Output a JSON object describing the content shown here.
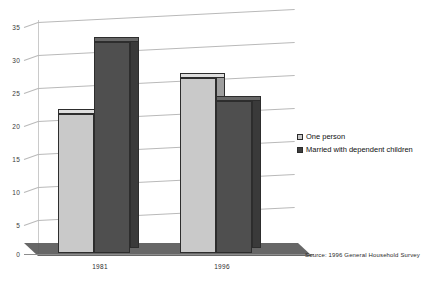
{
  "chart_data": {
    "type": "bar",
    "title": "",
    "subtitle": "",
    "xlabel": "",
    "ylabel": "",
    "categories": [
      "1981",
      "1996"
    ],
    "series": [
      {
        "name": "One person",
        "values": [
          21,
          26.5
        ],
        "color": "#c9c9c9"
      },
      {
        "name": "Married with dependent children",
        "values": [
          32,
          23
        ],
        "color": "#4f4f4f"
      }
    ],
    "ylim": [
      0,
      35
    ],
    "yticks": [
      0,
      5,
      10,
      15,
      20,
      25,
      30,
      35
    ],
    "ytick_labels": [
      "0",
      "5",
      "10",
      "15",
      "20",
      "25",
      "30",
      "35"
    ],
    "grid": true,
    "legend_position": "right",
    "style": "3d-bar-grayscale",
    "annotations": [
      "Source: 1996 General Household Survey"
    ]
  },
  "legend": {
    "items": [
      {
        "label": "One person",
        "swatch": "light-gray-square"
      },
      {
        "label": "Married with dependent children",
        "swatch": "dark-gray-square"
      }
    ]
  },
  "footer": {
    "source_note": "Source: 1996 General Household Survey"
  }
}
